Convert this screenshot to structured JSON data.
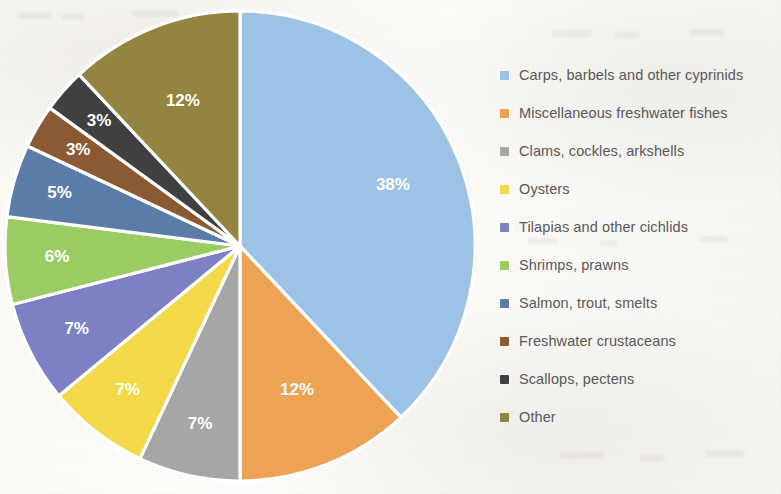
{
  "chart_data": {
    "type": "pie",
    "title": "",
    "subtitle": "",
    "xlabel": "",
    "ylabel": "",
    "legend_position": "right",
    "grid": false,
    "value_unit": "%",
    "start_angle_deg": 0,
    "direction": "clockwise",
    "categories": [
      "Carps, barbels and other cyprinids",
      "Miscellaneous freshwater fishes",
      "Clams, cockles, arkshells",
      "Oysters",
      "Tilapias and other cichlids",
      "Shrimps, prawns",
      "Salmon, trout, smelts",
      "Freshwater crustaceans",
      "Scallops, pectens",
      "Other"
    ],
    "values": [
      38,
      12,
      7,
      7,
      7,
      6,
      5,
      3,
      3,
      12
    ],
    "labels": [
      "38%",
      "12%",
      "7%",
      "7%",
      "7%",
      "6%",
      "5%",
      "3%",
      "3%",
      "12%"
    ],
    "colors": [
      "#9CC3E5",
      "#EDA254",
      "#A6A6A6",
      "#F3D948",
      "#7D81C4",
      "#9BCC63",
      "#5B7CA8",
      "#8C5A32",
      "#404040",
      "#938540"
    ],
    "slices": [
      {
        "name": "Carps, barbels and other cyprinids",
        "value": 38,
        "label": "38%",
        "color": "#9CC3E5",
        "label_color": "#FFFFFF"
      },
      {
        "name": "Miscellaneous freshwater fishes",
        "value": 12,
        "label": "12%",
        "color": "#EDA254",
        "label_color": "#FFFFFF"
      },
      {
        "name": "Clams, cockles, arkshells",
        "value": 7,
        "label": "7%",
        "color": "#A6A6A6",
        "label_color": "#FFFFFF"
      },
      {
        "name": "Oysters",
        "value": 7,
        "label": "7%",
        "color": "#F3D948",
        "label_color": "#FFFFFF"
      },
      {
        "name": "Tilapias and other cichlids",
        "value": 7,
        "label": "7%",
        "color": "#7D81C4",
        "label_color": "#FFFFFF"
      },
      {
        "name": "Shrimps, prawns",
        "value": 6,
        "label": "6%",
        "color": "#9BCC63",
        "label_color": "#FFFFFF"
      },
      {
        "name": "Salmon, trout, smelts",
        "value": 5,
        "label": "5%",
        "color": "#5B7CA8",
        "label_color": "#FFFFFF"
      },
      {
        "name": "Freshwater crustaceans",
        "value": 3,
        "label": "3%",
        "color": "#8C5A32",
        "label_color": "#FFFFFF"
      },
      {
        "name": "Scallops, pectens",
        "value": 3,
        "label": "3%",
        "color": "#404040",
        "label_color": "#FFFFFF"
      },
      {
        "name": "Other",
        "value": 12,
        "label": "12%",
        "color": "#938540",
        "label_color": "#FFFFFF"
      }
    ]
  },
  "legend": {
    "items": [
      {
        "label": "Carps, barbels and other cyprinids",
        "color": "#9CC3E5"
      },
      {
        "label": "Miscellaneous freshwater fishes",
        "color": "#EDA254"
      },
      {
        "label": "Clams, cockles, arkshells",
        "color": "#A6A6A6"
      },
      {
        "label": "Oysters",
        "color": "#F3D948"
      },
      {
        "label": "Tilapias and other cichlids",
        "color": "#7D81C4"
      },
      {
        "label": "Shrimps, prawns",
        "color": "#9BCC63"
      },
      {
        "label": "Salmon, trout, smelts",
        "color": "#5B7CA8"
      },
      {
        "label": "Freshwater crustaceans",
        "color": "#8C5A32"
      },
      {
        "label": "Scallops, pectens",
        "color": "#404040"
      },
      {
        "label": "Other",
        "color": "#938540"
      }
    ]
  }
}
